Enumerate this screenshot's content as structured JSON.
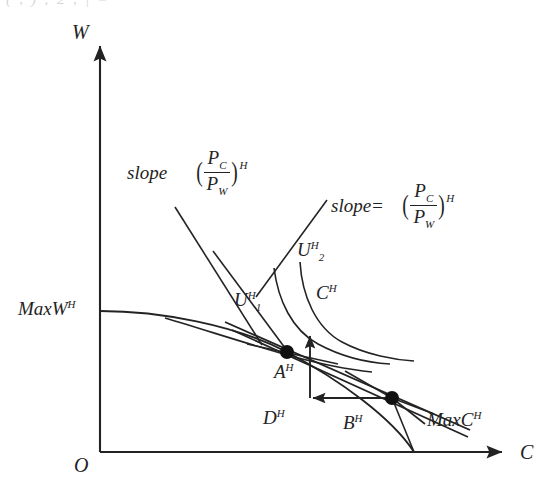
{
  "figure": {
    "kind": "economics-ppf-indifference-diagram",
    "background": "#ffffff",
    "line_color": "#232323",
    "text_color": "#232323",
    "top_cropped_text": "( , ) ; 2 , | =",
    "axes": {
      "y_axis_label": "W",
      "x_axis_label": "C",
      "origin_label": "O",
      "y_intercept_label": "MaxW",
      "y_intercept_sup": "H",
      "x_intercept_label": "MaxC",
      "x_intercept_sup": "H"
    },
    "points": [
      {
        "name": "A",
        "sup": "H",
        "label": "A",
        "x": 287,
        "y": 352
      },
      {
        "name": "B",
        "sup": "H",
        "label": "B",
        "x": 392,
        "y": 398
      }
    ],
    "curve_labels": [
      {
        "name": "U1",
        "base": "U",
        "sub": "1",
        "sup": "H"
      },
      {
        "name": "U2",
        "base": "U",
        "sub": "2",
        "sup": "H"
      },
      {
        "name": "C",
        "base": "C",
        "sub": "",
        "sup": "H"
      }
    ],
    "quantity_labels": [
      {
        "name": "D",
        "base": "D",
        "sup": "H"
      },
      {
        "name": "B",
        "base": "B",
        "sup": "H"
      }
    ],
    "slope_annotations": [
      {
        "name": "slope-left",
        "text": "slope",
        "numerator": "P",
        "numerator_sub": "C",
        "denominator": "P",
        "denominator_sub": "W",
        "exponent": "H"
      },
      {
        "name": "slope-right",
        "text": "slope=",
        "numerator": "P",
        "numerator_sub": "C",
        "denominator": "P",
        "denominator_sub": "W",
        "exponent": "H"
      }
    ]
  }
}
